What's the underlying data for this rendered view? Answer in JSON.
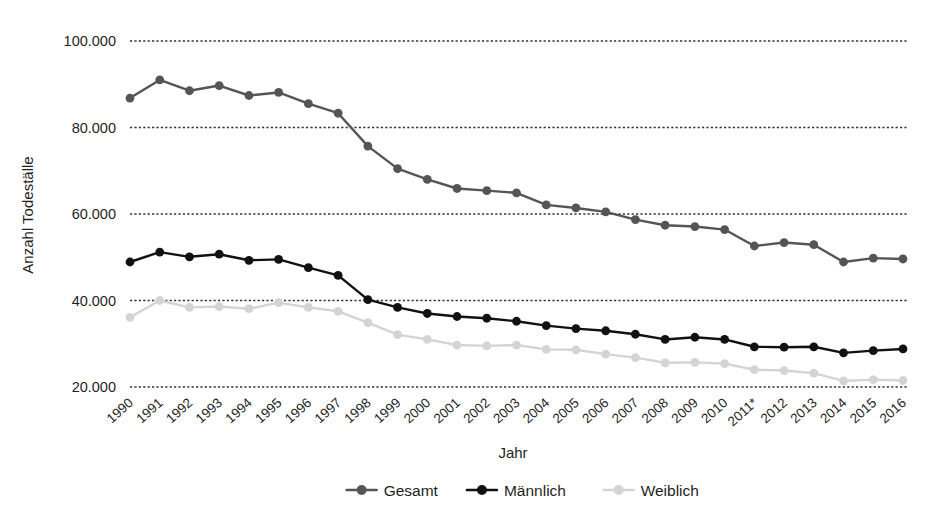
{
  "chart_data": {
    "type": "line",
    "title": "",
    "subtitle": "",
    "xlabel": "Jahr",
    "ylabel": "Anzahl Todeställe",
    "x": [
      "1990",
      "1991",
      "1992",
      "1993",
      "1994",
      "1995",
      "1996",
      "1997",
      "1998",
      "1999",
      "2000",
      "2001",
      "2002",
      "2003",
      "2004",
      "2005",
      "2006",
      "2007",
      "2008",
      "2009",
      "2010",
      "2011*",
      "2012",
      "2013",
      "2014",
      "2015",
      "2016"
    ],
    "categories": [
      "1990",
      "1991",
      "1992",
      "1993",
      "1994",
      "1995",
      "1996",
      "1997",
      "1998",
      "1999",
      "2000",
      "2001",
      "2002",
      "2003",
      "2004",
      "2005",
      "2006",
      "2007",
      "2008",
      "2009",
      "2010",
      "2011*",
      "2012",
      "2013",
      "2014",
      "2015",
      "2016"
    ],
    "ylim": [
      14000,
      104000
    ],
    "yticks": [
      20000,
      40000,
      60000,
      80000,
      100000
    ],
    "ytick_labels": [
      "20.000",
      "40.000",
      "60.000",
      "80.000",
      "100.000"
    ],
    "grid": true,
    "grid_axis": "y",
    "legend_position": "bottom",
    "series": [
      {
        "name": "Gesamt",
        "color": "#555555",
        "marker": "circle",
        "values": [
          86800,
          91000,
          88500,
          89700,
          87400,
          88100,
          85500,
          83300,
          75700,
          70500,
          68000,
          65900,
          65400,
          64900,
          62100,
          61400,
          60500,
          58700,
          57400,
          57100,
          56400,
          52600,
          53400,
          52900,
          48900,
          49800,
          49600
        ]
      },
      {
        "name": "Männlich",
        "color": "#111111",
        "marker": "circle",
        "values": [
          48900,
          51200,
          50100,
          50700,
          49300,
          49500,
          47600,
          45800,
          40200,
          38400,
          37000,
          36300,
          35900,
          35200,
          34200,
          33500,
          33000,
          32200,
          31000,
          31500,
          31000,
          29300,
          29200,
          29300,
          27900,
          28400,
          28800
        ]
      },
      {
        "name": "Weiblich",
        "color": "#d4d4d4",
        "marker": "circle",
        "values": [
          36100,
          40000,
          38400,
          38600,
          38100,
          39500,
          38400,
          37500,
          34900,
          32100,
          31000,
          29700,
          29500,
          29700,
          28700,
          28600,
          27600,
          26800,
          25600,
          25700,
          25400,
          24000,
          23800,
          23200,
          21400,
          21700,
          21500
        ]
      }
    ],
    "annotations": [
      {
        "text": "2011*",
        "note": "asterisk on 2011 x tick label"
      }
    ]
  },
  "legend": {
    "items": [
      {
        "label": "Gesamt",
        "color": "#555555"
      },
      {
        "label": "Männlich",
        "color": "#111111"
      },
      {
        "label": "Weiblich",
        "color": "#d4d4d4"
      }
    ]
  },
  "axes": {
    "y_title": "Anzahl Todeställe",
    "x_title": "Jahr",
    "y_tick_labels": [
      "100.000",
      "80.000",
      "60.000",
      "40.000",
      "20.000"
    ],
    "grid_color": "#333333"
  }
}
